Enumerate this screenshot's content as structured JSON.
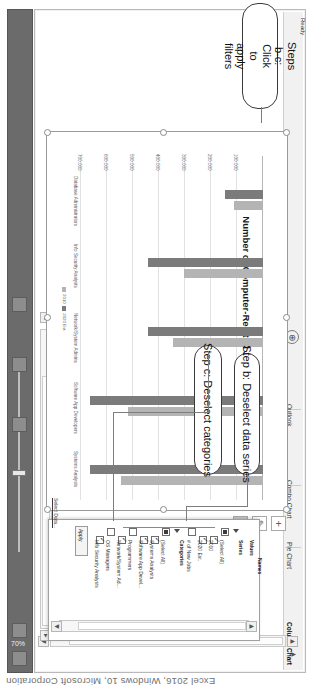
{
  "caption": "Excel 2016, Windows 10, Microsoft Corporation",
  "window": {
    "zoom_label": "70%",
    "status_text": "Ready"
  },
  "sheet_tabs": {
    "items": [
      {
        "label": "Column Chart",
        "active": true
      },
      {
        "label": "Pie Chart",
        "active": false
      },
      {
        "label": "Combo Chart",
        "active": false
      },
      {
        "label": "Outlook",
        "active": false
      }
    ],
    "add_sheet_label": "⊕",
    "nav_prev": "◀",
    "nav_next": "▶"
  },
  "chart_buttons": {
    "add_element": "+",
    "styles": "✐",
    "filters": "▼"
  },
  "filter_panel": {
    "header_values": "Values",
    "header_series": "Series",
    "header_names": "Names",
    "header_categories": "Categories",
    "series": [
      {
        "label": "(Select All)",
        "state": "checked"
      },
      {
        "label": "2010",
        "state": "tick"
      },
      {
        "label": "2020 Est.",
        "state": "tick"
      },
      {
        "label": "# of New Jobs",
        "state": "unchecked"
      }
    ],
    "categories": [
      {
        "label": "(Select All)",
        "state": "checked"
      },
      {
        "label": "Systems Analysts",
        "state": "tick"
      },
      {
        "label": "Software App Devel...",
        "state": "tick"
      },
      {
        "label": "Programmers",
        "state": "unchecked"
      },
      {
        "label": "Network/System Ad...",
        "state": "tick"
      },
      {
        "label": "OS Managers",
        "state": "unchecked"
      },
      {
        "label": "Info Security Analysts",
        "state": "tick"
      }
    ],
    "apply_label": "Apply",
    "select_data_label": "Select Data..."
  },
  "callouts": [
    {
      "id": "step-b",
      "text": "Step b: Deselect data series"
    },
    {
      "id": "step-c",
      "text": "Step c: Deselect categories"
    },
    {
      "id": "step-bc",
      "text": "Steps b-c: Click to apply filters"
    }
  ],
  "chart_data": {
    "type": "bar",
    "title": "Number of Computer-Related Jobs 2010 and 2020",
    "xlabel": "",
    "ylabel": "",
    "xlim": [
      0,
      700000
    ],
    "grid": true,
    "legend_position": "bottom",
    "tick_labels": [
      "0",
      "100,000",
      "200,000",
      "300,000",
      "400,000",
      "500,000",
      "600,000",
      "700,000"
    ],
    "categories": [
      "Systems Analysts",
      "Software App Developers",
      "Network/System Admins",
      "Info Security Analysts",
      "Database Administrators"
    ],
    "series": [
      {
        "name": "2010",
        "color": "#b4b4b4",
        "values": [
          544400,
          520800,
          347200,
          302700,
          110800
        ]
      },
      {
        "name": "2020 Est.",
        "color": "#7b7b7b",
        "values": [
          664800,
          664500,
          443800,
          443000,
          144700
        ]
      }
    ]
  }
}
